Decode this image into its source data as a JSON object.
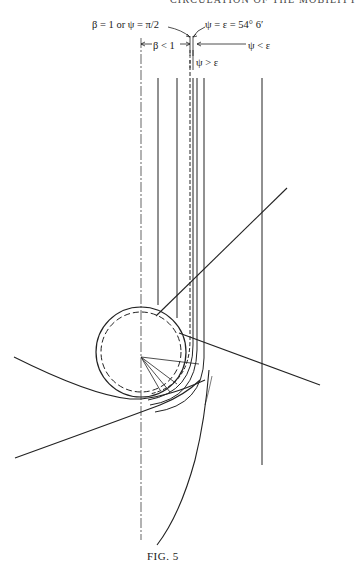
{
  "page": {
    "running_header": "CIRCULATION OF THE MOBILITY",
    "caption": "FIG. 5"
  },
  "annotations": {
    "beta_one": "β = 1 or ψ = π/2",
    "psi_eps": "ψ = ε = 54° 6′",
    "beta_lt_one": "β < 1",
    "psi_lt_eps": "ψ < ε",
    "psi_gt_eps": "ψ > ε"
  },
  "diagram": {
    "line_color": "#222222",
    "circle": {
      "cx": 141,
      "cy": 352,
      "r_outer": 45,
      "r_inner": 40
    },
    "vertical_lines_x": [
      158,
      177,
      190,
      193,
      197,
      204,
      262
    ],
    "centerline_x": 141
  }
}
